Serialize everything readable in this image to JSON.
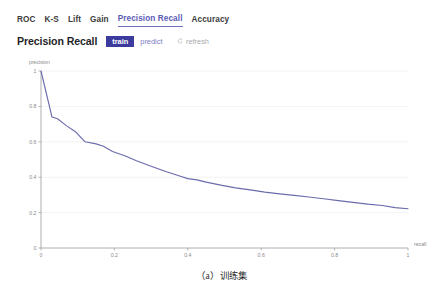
{
  "tabs": [
    {
      "label": "ROC",
      "active": false
    },
    {
      "label": "K-S",
      "active": false
    },
    {
      "label": "Lift",
      "active": false
    },
    {
      "label": "Gain",
      "active": false
    },
    {
      "label": "Precision Recall",
      "active": true
    },
    {
      "label": "Accuracy",
      "active": false
    }
  ],
  "panel": {
    "title": "Precision Recall",
    "segments": [
      {
        "label": "train",
        "active": true
      },
      {
        "label": "predict",
        "active": false
      }
    ],
    "refresh_label": "refresh",
    "refresh_icon": "refresh-circular-arrow-icon"
  },
  "caption": "（a）训练集",
  "colors": {
    "accent": "#5b5bb5",
    "segment_active_bg": "#3b3b9e",
    "segment_inactive_text": "#7b7bc4",
    "curve": "#6b6bab",
    "axis": "#9a9a9a",
    "grid": "#eeeeee",
    "tick_text": "#8a8a8a"
  },
  "chart_data": {
    "type": "line",
    "title": "",
    "xlabel": "recall",
    "ylabel": "precision",
    "xlim": [
      0,
      1
    ],
    "ylim": [
      0,
      1
    ],
    "xticks": [
      "0",
      "0.2",
      "0.4",
      "0.6",
      "0.8",
      "1"
    ],
    "xtick_values": [
      0,
      0.2,
      0.4,
      0.6,
      0.8,
      1
    ],
    "yticks": [
      "0",
      "0.2",
      "0.4",
      "0.6",
      "0.8",
      "1"
    ],
    "ytick_values": [
      0,
      0.2,
      0.4,
      0.6,
      0.8,
      1
    ],
    "grid": true,
    "legend": null,
    "series": [
      {
        "name": "train",
        "color": "#6b6bab",
        "x": [
          0.0,
          0.03,
          0.045,
          0.07,
          0.095,
          0.12,
          0.15,
          0.17,
          0.195,
          0.23,
          0.26,
          0.3,
          0.34,
          0.38,
          0.4,
          0.425,
          0.45,
          0.49,
          0.53,
          0.57,
          0.61,
          0.65,
          0.69,
          0.73,
          0.77,
          0.81,
          0.85,
          0.89,
          0.93,
          0.965,
          1.0
        ],
        "y": [
          1.0,
          0.74,
          0.73,
          0.69,
          0.655,
          0.6,
          0.588,
          0.575,
          0.545,
          0.52,
          0.493,
          0.462,
          0.432,
          0.405,
          0.392,
          0.385,
          0.372,
          0.355,
          0.34,
          0.328,
          0.316,
          0.306,
          0.297,
          0.288,
          0.278,
          0.268,
          0.258,
          0.248,
          0.24,
          0.228,
          0.222
        ]
      }
    ]
  }
}
